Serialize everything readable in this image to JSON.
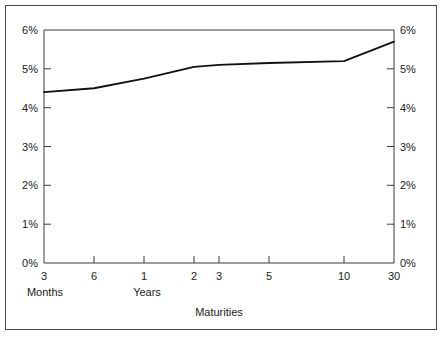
{
  "chart_data": {
    "type": "line",
    "title": "",
    "subtitle": "",
    "xlabel": "Maturities",
    "ylabel": "",
    "grid": false,
    "legend": null,
    "axis_label_groups": [
      {
        "label": "Months",
        "ticks": [
          "3",
          "6"
        ]
      },
      {
        "label": "Years",
        "ticks": [
          "1",
          "2",
          "3",
          "5",
          "10",
          "30"
        ]
      }
    ],
    "categories": [
      "3",
      "6",
      "1",
      "2",
      "3",
      "5",
      "10",
      "30"
    ],
    "x_tick_labels": [
      "3",
      "6",
      "1",
      "2",
      "3",
      "5",
      "10",
      "30"
    ],
    "y_tick_labels_left": [
      "0%",
      "1%",
      "2%",
      "3%",
      "4%",
      "5%",
      "6%"
    ],
    "y_tick_labels_right": [
      "0%",
      "1%",
      "2%",
      "3%",
      "4%",
      "5%",
      "6%"
    ],
    "ylim": [
      0,
      6
    ],
    "ylim_unit": "percent",
    "xlim_categories": 8,
    "series": [
      {
        "name": "Yield curve",
        "color": "#111111",
        "values": [
          4.4,
          4.5,
          4.75,
          5.05,
          5.1,
          5.15,
          5.2,
          5.7
        ]
      }
    ]
  },
  "colors": {
    "line": "#111111",
    "axis": "#3a3a3a",
    "frame": "#4a4a4a",
    "text": "#1a1a1a",
    "background": "#ffffff"
  }
}
